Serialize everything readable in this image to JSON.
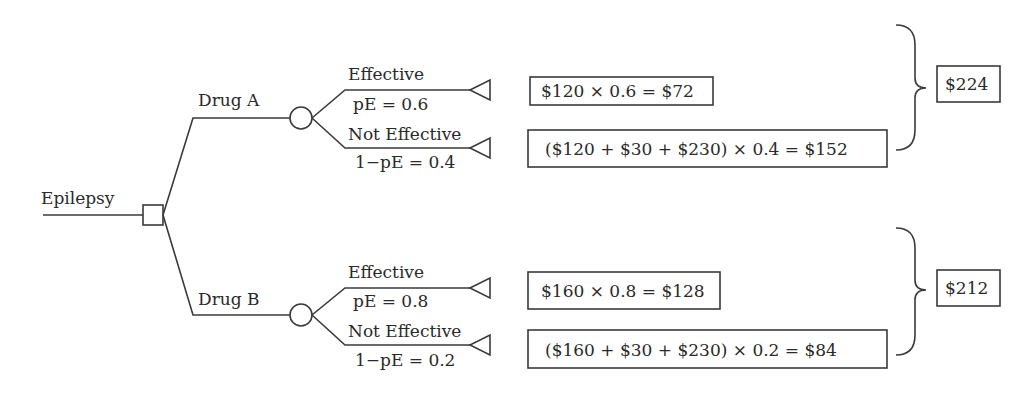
{
  "diagram": {
    "root": {
      "label": "Epilepsy",
      "node_type": "decision-square"
    },
    "branches": [
      {
        "label": "Drug A",
        "node_type": "chance-circle",
        "outcomes": [
          {
            "label": "Effective",
            "prob_label": "pE = 0.6",
            "calc": "$120 × 0.6 = $72"
          },
          {
            "label": "Not Effective",
            "prob_label": "1−pE = 0.4",
            "calc": "($120 + $30 + $230) × 0.4 = $152"
          }
        ],
        "expected_value": "$224"
      },
      {
        "label": "Drug B",
        "node_type": "chance-circle",
        "outcomes": [
          {
            "label": "Effective",
            "prob_label": "pE = 0.8",
            "calc": "$160 × 0.8 = $128"
          },
          {
            "label": "Not Effective",
            "prob_label": "1−pE = 0.2",
            "calc": "($160 + $30 + $230) × 0.2 = $84"
          }
        ],
        "expected_value": "$212"
      }
    ],
    "colors": {
      "line": "#3a3a3a",
      "text": "#2a2a2a",
      "background": "#ffffff"
    }
  }
}
